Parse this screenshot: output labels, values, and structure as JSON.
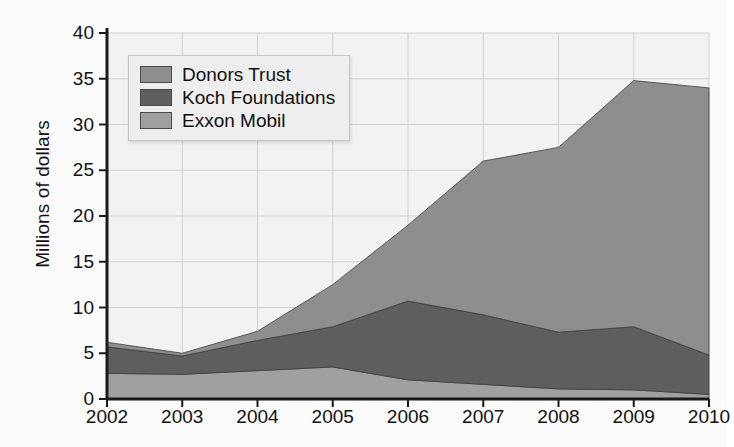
{
  "chart_data": {
    "type": "area",
    "stacked": true,
    "title": "",
    "xlabel": "",
    "ylabel": "Millions of dollars",
    "categories": [
      "2002",
      "2003",
      "2004",
      "2005",
      "2006",
      "2007",
      "2008",
      "2009",
      "2010"
    ],
    "x": [
      2002,
      2003,
      2004,
      2005,
      2006,
      2007,
      2008,
      2009,
      2010
    ],
    "xlim": [
      2002,
      2010
    ],
    "ylim": [
      0,
      40
    ],
    "yticks": [
      0,
      5,
      10,
      15,
      20,
      25,
      30,
      35,
      40
    ],
    "xticks": [
      2002,
      2003,
      2004,
      2005,
      2006,
      2007,
      2008,
      2009,
      2010
    ],
    "grid": true,
    "legend_position": "top-left",
    "stack_order_bottom_to_top": [
      "Exxon Mobil",
      "Koch Foundations",
      "Donors Trust"
    ],
    "series": [
      {
        "name": "Donors Trust",
        "color": "#8e8e8e",
        "values": [
          0.5,
          0.3,
          1.0,
          4.6,
          8.3,
          16.8,
          20.2,
          26.9,
          29.2
        ]
      },
      {
        "name": "Koch Foundations",
        "color": "#5e5e5e",
        "values": [
          2.9,
          2.0,
          3.3,
          4.4,
          8.6,
          7.6,
          6.2,
          6.9,
          4.3
        ]
      },
      {
        "name": "Exxon Mobil",
        "color": "#a0a0a0",
        "values": [
          2.8,
          2.7,
          3.1,
          3.5,
          2.1,
          1.6,
          1.1,
          1.0,
          0.5
        ]
      }
    ],
    "stacked_totals": [
      6.2,
      5.0,
      7.4,
      12.5,
      19.0,
      26.0,
      27.5,
      34.8,
      34.0
    ],
    "colors": {
      "donors_trust": "#8e8e8e",
      "koch_foundations": "#5e5e5e",
      "exxon_mobil": "#a0a0a0",
      "plot_background": "#f2f2f2",
      "gridlines": "#d0d0d0",
      "axis": "#1a1a1a",
      "legend_background": "#eeeeee"
    }
  },
  "axes": {
    "y_title": "Millions of dollars",
    "y_tick_labels": [
      "40",
      "35",
      "30",
      "25",
      "20",
      "15",
      "10",
      "5",
      "0"
    ],
    "x_tick_labels": [
      "2002",
      "2003",
      "2004",
      "2005",
      "2006",
      "2007",
      "2008",
      "2009",
      "2010"
    ]
  },
  "legend": {
    "items": [
      {
        "label": "Donors Trust",
        "color": "#8e8e8e"
      },
      {
        "label": "Koch Foundations",
        "color": "#5e5e5e"
      },
      {
        "label": "Exxon Mobil",
        "color": "#a0a0a0"
      }
    ]
  }
}
